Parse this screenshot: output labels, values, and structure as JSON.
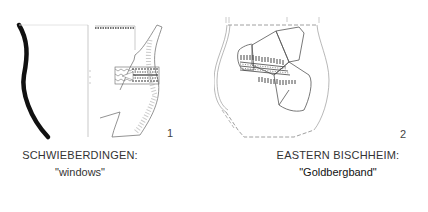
{
  "figures": [
    {
      "number": "1",
      "caption_title": "SCHWIEBERDINGEN:",
      "caption_subtitle": "\"windows\""
    },
    {
      "number": "2",
      "caption_title": "EASTERN BISCHHEIM:",
      "caption_subtitle": "\"Goldbergband\""
    }
  ],
  "colors": {
    "ink": "#111111",
    "line": "#555555",
    "background": "#ffffff"
  }
}
